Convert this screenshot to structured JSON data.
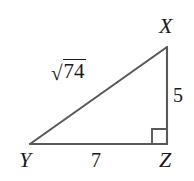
{
  "figure": {
    "kind": "right-triangle-diagram",
    "background_color": "#ffffff",
    "stroke_color": "#595959",
    "text_color": "#1a1a1a",
    "width": 194,
    "height": 181,
    "vertices": {
      "x": {
        "label": "X",
        "px": 167,
        "py": 47
      },
      "y": {
        "label": "Y",
        "px": 30,
        "py": 144
      },
      "z": {
        "label": "Z",
        "px": 167,
        "py": 144
      }
    },
    "right_angle": {
      "at_vertex": "Z",
      "marker": "square",
      "size": 15
    },
    "sides": {
      "hypotenuse": {
        "from": "X",
        "to": "Y",
        "radical_sign": "√",
        "radicand": "74",
        "label": "√74"
      },
      "vertical_leg": {
        "from": "X",
        "to": "Z",
        "label": "5"
      },
      "horizontal_leg": {
        "from": "Y",
        "to": "Z",
        "label": "7"
      }
    }
  }
}
